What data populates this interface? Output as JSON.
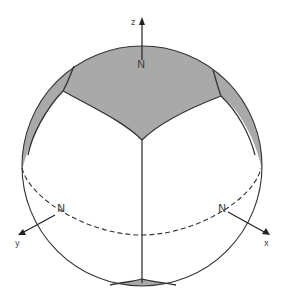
{
  "diagram": {
    "type": "sphere-with-spherical-faces",
    "colors": {
      "outline": "#333333",
      "shade": "#a9a9a9",
      "background": "#ffffff"
    },
    "axes": {
      "z": {
        "label": "z",
        "pole_label": "N"
      },
      "y": {
        "label": "y",
        "pole_label": "N"
      },
      "x": {
        "label": "x",
        "pole_label": "N"
      }
    }
  }
}
